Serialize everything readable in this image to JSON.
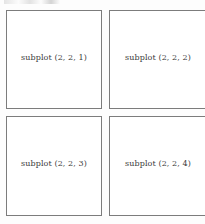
{
  "figure": {
    "background_color": "#fdfdfd",
    "axes_face_color": "#ffffff",
    "axes_edge_color": "#7c7c7c",
    "label_color": "#3a3a3a"
  },
  "chart_data": {
    "type": "table",
    "title": "",
    "subtitle": "",
    "xlabel": "",
    "ylabel": "",
    "grid": false,
    "legend": "none",
    "layout": {
      "rows": 2,
      "cols": 2,
      "description": "2 by 2 grid of empty subplot axes, each annotated with its subplot index"
    },
    "categories": [
      "subplot (2, 2, 1)",
      "subplot (2, 2, 2)",
      "subplot (2, 2, 3)",
      "subplot (2, 2, 4)"
    ],
    "values": [
      1,
      2,
      3,
      4
    ],
    "annotations": [
      {
        "index": 1,
        "row": 1,
        "col": 1,
        "text": "subplot (2, 2, 1)"
      },
      {
        "index": 2,
        "row": 1,
        "col": 2,
        "text": "subplot (2, 2, 2)"
      },
      {
        "index": 3,
        "row": 2,
        "col": 1,
        "text": "subplot (2, 2, 3)"
      },
      {
        "index": 4,
        "row": 2,
        "col": 2,
        "text": "subplot (2, 2, 4)"
      }
    ]
  },
  "panels": [
    {
      "id": 1,
      "label": "subplot (2, 2, 1)"
    },
    {
      "id": 2,
      "label": "subplot (2, 2, 2)"
    },
    {
      "id": 3,
      "label": "subplot (2, 2, 3)"
    },
    {
      "id": 4,
      "label": "subplot (2, 2, 4)"
    }
  ]
}
